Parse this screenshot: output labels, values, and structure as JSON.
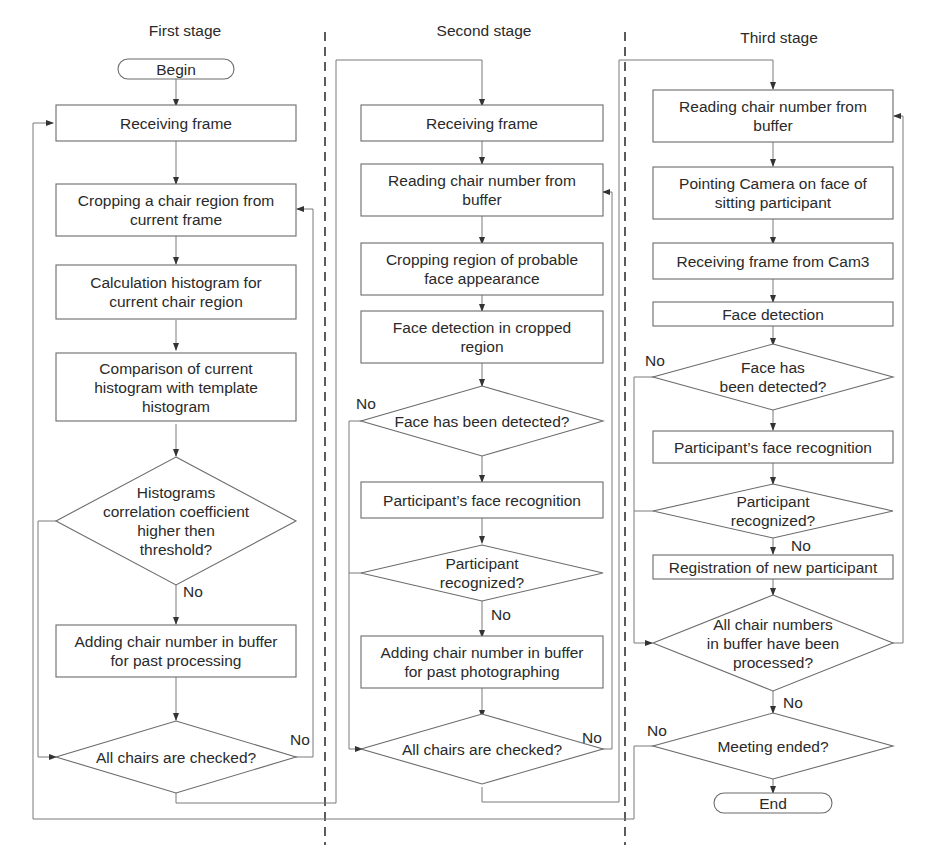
{
  "stages": [
    {
      "title": "First stage",
      "nodes": [
        {
          "id": "begin",
          "type": "terminal",
          "lines": [
            "Begin"
          ]
        },
        {
          "id": "s1-receive",
          "type": "process",
          "lines": [
            "Receiving frame"
          ]
        },
        {
          "id": "s1-crop",
          "type": "process",
          "lines": [
            "Cropping a chair region from",
            "current frame"
          ]
        },
        {
          "id": "s1-hist",
          "type": "process",
          "lines": [
            "Calculation histogram for",
            "current chair region"
          ]
        },
        {
          "id": "s1-compare",
          "type": "process",
          "lines": [
            "Comparison of current",
            "histogram with template",
            "histogram"
          ]
        },
        {
          "id": "s1-corr",
          "type": "decision",
          "lines": [
            "Histograms",
            "correlation coefficient",
            "higher then",
            "threshold?"
          ]
        },
        {
          "id": "s1-add",
          "type": "process",
          "lines": [
            "Adding chair number in buffer",
            "for past processing"
          ]
        },
        {
          "id": "s1-all",
          "type": "decision",
          "lines": [
            "All chairs are checked?"
          ]
        }
      ]
    },
    {
      "title": "Second stage",
      "nodes": [
        {
          "id": "s2-receive",
          "type": "process",
          "lines": [
            "Receiving frame"
          ]
        },
        {
          "id": "s2-read",
          "type": "process",
          "lines": [
            "Reading chair number from",
            "buffer"
          ]
        },
        {
          "id": "s2-crop",
          "type": "process",
          "lines": [
            "Cropping region of probable",
            "face appearance"
          ]
        },
        {
          "id": "s2-detect",
          "type": "process",
          "lines": [
            "Face detection in cropped",
            "region"
          ]
        },
        {
          "id": "s2-detected",
          "type": "decision",
          "lines": [
            "Face has been detected?"
          ]
        },
        {
          "id": "s2-recog",
          "type": "process",
          "lines": [
            "Participant’s face recognition"
          ]
        },
        {
          "id": "s2-recognized",
          "type": "decision",
          "lines": [
            "Participant",
            "recognized?"
          ]
        },
        {
          "id": "s2-add",
          "type": "process",
          "lines": [
            "Adding chair number in buffer",
            "for past photographing"
          ]
        },
        {
          "id": "s2-all",
          "type": "decision",
          "lines": [
            "All chairs are checked?"
          ]
        }
      ]
    },
    {
      "title": "Third stage",
      "nodes": [
        {
          "id": "s3-read",
          "type": "process",
          "lines": [
            "Reading chair number from",
            "buffer"
          ]
        },
        {
          "id": "s3-point",
          "type": "process",
          "lines": [
            "Pointing Camera on face of",
            "sitting participant"
          ]
        },
        {
          "id": "s3-receive",
          "type": "process",
          "lines": [
            "Receiving frame from Cam3"
          ]
        },
        {
          "id": "s3-detect",
          "type": "process",
          "lines": [
            "Face detection"
          ]
        },
        {
          "id": "s3-detected",
          "type": "decision",
          "lines": [
            "Face has",
            "been detected?"
          ]
        },
        {
          "id": "s3-recog",
          "type": "process",
          "lines": [
            "Participant’s face recognition"
          ]
        },
        {
          "id": "s3-recognized",
          "type": "decision",
          "lines": [
            "Participant",
            "recognized?"
          ]
        },
        {
          "id": "s3-register",
          "type": "process",
          "lines": [
            "Registration of new participant"
          ]
        },
        {
          "id": "s3-all",
          "type": "decision",
          "lines": [
            "All chair numbers",
            "in buffer have been",
            "processed?"
          ]
        },
        {
          "id": "s3-meeting",
          "type": "decision",
          "lines": [
            "Meeting ended?"
          ]
        },
        {
          "id": "end",
          "type": "terminal",
          "lines": [
            "End"
          ]
        }
      ]
    }
  ],
  "edge_labels": {
    "s1_corr_no": "No",
    "s1_all_no": "No",
    "s2_detected_no": "No",
    "s2_recognized_no": "No",
    "s2_all_no": "No",
    "s3_detected_no": "No",
    "s3_recognized_no": "No",
    "s3_all_no": "No",
    "s3_meeting_no": "No"
  }
}
